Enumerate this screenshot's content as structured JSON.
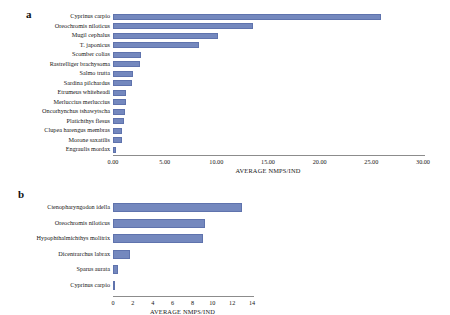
{
  "figure": {
    "panels": [
      {
        "letter": "a",
        "axis_title": "AVERAGE  NMPS/IND",
        "ticks": [
          "0.00",
          "5.00",
          "10.00",
          "15.00",
          "20.00",
          "25.00",
          "30.00"
        ],
        "bar_color": "#7488be"
      },
      {
        "letter": "b",
        "axis_title": "AVERAGE  NMPS/IND",
        "ticks": [
          "0",
          "2",
          "4",
          "6",
          "8",
          "10",
          "12",
          "14"
        ],
        "bar_color": "#7488be"
      }
    ]
  },
  "chart_data": [
    {
      "type": "bar",
      "orientation": "horizontal",
      "title": "a",
      "xlabel": "AVERAGE  NMPS/IND",
      "ylabel": "",
      "xlim": [
        0,
        30
      ],
      "xticks": [
        0,
        5,
        10,
        15,
        20,
        25,
        30
      ],
      "xtick_labels": [
        "0.00",
        "5.00",
        "10.00",
        "15.00",
        "20.00",
        "25.00",
        "30.00"
      ],
      "grid": false,
      "legend": "none",
      "categories": [
        "Cyprinus carpio",
        "Oreochromis niloticus",
        "Mugil cephalus",
        "T. japonicus",
        "Scomber colias",
        "Rastrelliger brachysoma",
        "Salmo trutta",
        "Sardina pilchardus",
        "Etrumeus whiteheadi",
        "Merluccius merluccius",
        "Oncorhynchus tshawytscha",
        "Platichthys flesus",
        "Clupea harengus membras",
        "Morone saxatilis",
        "Engraulis mordax"
      ],
      "values": [
        25.9,
        13.5,
        10.2,
        8.3,
        2.7,
        2.6,
        1.9,
        1.8,
        1.3,
        1.3,
        1.2,
        1.1,
        0.9,
        0.9,
        0.3
      ]
    },
    {
      "type": "bar",
      "orientation": "horizontal",
      "title": "b",
      "xlabel": "AVERAGE  NMPS/IND",
      "ylabel": "",
      "xlim": [
        0,
        14
      ],
      "xticks": [
        0,
        2,
        4,
        6,
        8,
        10,
        12,
        14
      ],
      "xtick_labels": [
        "0",
        "2",
        "4",
        "6",
        "8",
        "10",
        "12",
        "14"
      ],
      "grid": false,
      "legend": "none",
      "categories": [
        "Ctenopharyngodon idella",
        "Oreochromis niloticus",
        "Hypophthalmichthys molitrix",
        "Dicentrarchus labrax",
        "Sparus aurata",
        "Cyprinus carpio"
      ],
      "values": [
        13.0,
        9.3,
        9.1,
        1.7,
        0.5,
        0.05
      ]
    }
  ]
}
